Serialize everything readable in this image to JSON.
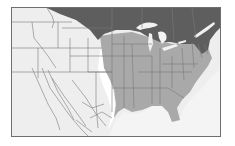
{
  "map": {
    "title": "",
    "region": "North America (contiguous United States, southern Canada, northern Mexico)",
    "legend": [
      {
        "name": "northern-range",
        "color": "#5e5e5e"
      },
      {
        "name": "primary-range",
        "color": "#a9a9a9"
      },
      {
        "name": "outside-range-land",
        "color": "#eeeeee"
      },
      {
        "name": "margin-zone",
        "color": "#ffffff"
      },
      {
        "name": "water",
        "color": "#f4f4f4"
      }
    ],
    "colors": {
      "frame_border": "#6f6f6f",
      "boundary_lines": "#7a7a7a",
      "dark_region": "#5e5e5e",
      "medium_region": "#a9a9a9",
      "light_land": "#eeeeee",
      "lakes": "#f2f2f2"
    }
  }
}
